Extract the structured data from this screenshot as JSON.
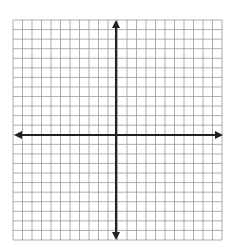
{
  "diagram": {
    "type": "coordinate-grid",
    "grid": {
      "left": 13,
      "top": 20,
      "right": 222,
      "bottom": 240,
      "columns": 22,
      "rows": 23,
      "line_color": "#9a9a9a",
      "line_width": 0.8
    },
    "axes": {
      "color": "#222222",
      "width": 2,
      "x_axis": {
        "y": 135,
        "x_start": 14,
        "x_end": 223,
        "arrows": "both"
      },
      "y_axis": {
        "x": 116,
        "y_start": 20,
        "y_end": 240,
        "arrows": "both"
      }
    }
  }
}
